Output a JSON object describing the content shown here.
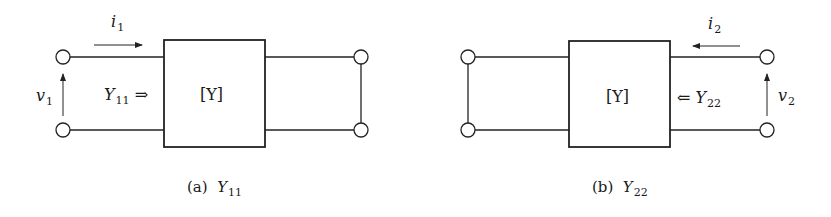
{
  "panels": [
    {
      "id": "a",
      "matrix_label": "[Y]",
      "current": {
        "symbol": "i",
        "subscript": "1",
        "direction": "right"
      },
      "voltage": {
        "symbol": "v",
        "subscript": "1",
        "direction": "up"
      },
      "admittance": {
        "symbol": "Y",
        "subscript": "11",
        "arrow": "⇒"
      },
      "shorted_port": "port-2",
      "caption": {
        "tag": "(a)",
        "symbol": "Y",
        "subscript": "11"
      }
    },
    {
      "id": "b",
      "matrix_label": "[Y]",
      "current": {
        "symbol": "i",
        "subscript": "2",
        "direction": "left"
      },
      "voltage": {
        "symbol": "v",
        "subscript": "2",
        "direction": "up"
      },
      "admittance": {
        "symbol": "Y",
        "subscript": "22",
        "arrow": "⇐"
      },
      "shorted_port": "port-1",
      "caption": {
        "tag": "(b)",
        "symbol": "Y",
        "subscript": "22"
      }
    }
  ],
  "colors": {
    "stroke": "#222222",
    "background": "#ffffff"
  }
}
